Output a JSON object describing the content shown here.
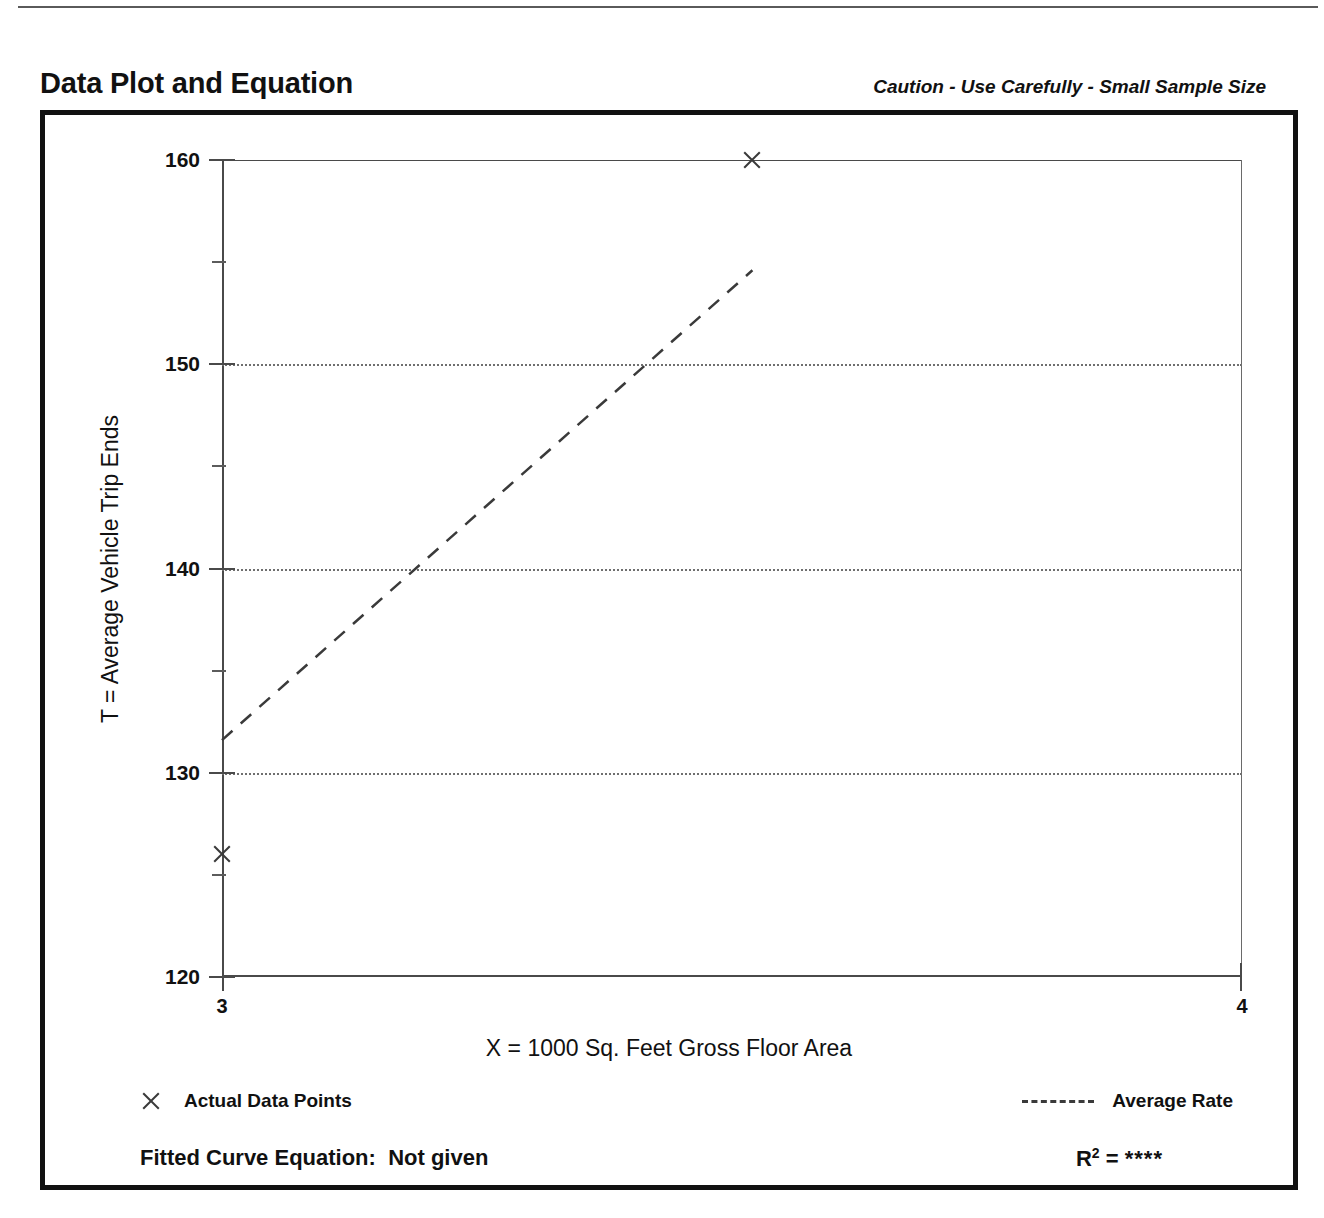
{
  "header": {
    "title": "Data Plot and Equation",
    "caution": "Caution - Use Carefully - Small Sample Size"
  },
  "legend": {
    "points_marker_icon": "x-marker-icon",
    "points_label": "Actual Data Points",
    "rate_line_icon": "dashed-line-icon",
    "rate_label": "Average Rate"
  },
  "footer": {
    "equation_label": "Fitted Curve Equation:",
    "equation_value": "Not given",
    "r2_label": "R",
    "r2_exponent": "2",
    "r2_equals": "=",
    "r2_value": "****"
  },
  "chart_data": {
    "type": "scatter",
    "title": "Data Plot and Equation",
    "subtitle": "Caution - Use Carefully - Small Sample Size",
    "xlabel": "X = 1000 Sq. Feet Gross Floor Area",
    "ylabel": "T = Average Vehicle Trip Ends",
    "xlim": [
      3,
      4
    ],
    "ylim": [
      120,
      160
    ],
    "x_ticks": [
      3,
      4
    ],
    "x_tick_labels": [
      "3",
      "4"
    ],
    "y_ticks": [
      120,
      130,
      140,
      150,
      160
    ],
    "y_tick_labels": [
      "120",
      "130",
      "140",
      "150",
      "160"
    ],
    "y_minor_ticks": [
      125,
      135,
      145,
      155
    ],
    "grid": true,
    "gridlines_y": [
      130,
      140,
      150
    ],
    "legend_position": "below-plot",
    "series": [
      {
        "name": "Actual Data Points",
        "type": "scatter",
        "marker": "x",
        "points": [
          {
            "x": 3.0,
            "y": 126.0
          },
          {
            "x": 3.52,
            "y": 160.0
          }
        ]
      },
      {
        "name": "Average Rate",
        "type": "line",
        "style": "dashed",
        "points": [
          {
            "x": 3.0,
            "y": 131.6
          },
          {
            "x": 3.52,
            "y": 154.6
          }
        ]
      }
    ],
    "fitted_curve_equation": "Not given",
    "r_squared": "****"
  }
}
